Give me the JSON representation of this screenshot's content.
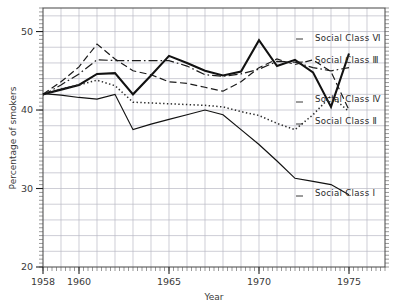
{
  "chart_data": {
    "type": "line",
    "title": "",
    "xlabel": "Year",
    "ylabel": "Percentage of smokers",
    "xlim": [
      1958,
      1977
    ],
    "ylim": [
      20,
      53
    ],
    "grid": true,
    "legend_position": "right-inline",
    "x_ticks": [
      "1958",
      "1960",
      "1965",
      "1970",
      "1975"
    ],
    "x_tick_values": [
      1958,
      1960,
      1965,
      1970,
      1975
    ],
    "y_ticks": [
      "20",
      "30",
      "40",
      "50"
    ],
    "y_tick_values": [
      20,
      30,
      40,
      50
    ],
    "x": [
      1958,
      1959,
      1960,
      1961,
      1962,
      1963,
      1964,
      1965,
      1966,
      1967,
      1968,
      1969,
      1970,
      1971,
      1972,
      1973,
      1974,
      1975
    ],
    "series": [
      {
        "name": "Social Class V",
        "label": "Social Class Ⅵ",
        "style": "solid-bold",
        "color": "#111111",
        "values": [
          42.0,
          42.6,
          43.2,
          44.6,
          44.7,
          42.0,
          44.4,
          46.9,
          46.0,
          45.0,
          44.4,
          44.9,
          48.9,
          45.6,
          46.4,
          44.8,
          40.4,
          47.2
        ]
      },
      {
        "name": "Social Class III",
        "label": "Social Class Ⅲ",
        "style": "dash-dot",
        "color": "#1b1b1b",
        "values": [
          41.9,
          43.2,
          44.6,
          46.4,
          46.3,
          46.3,
          46.3,
          46.3,
          45.6,
          44.5,
          44.3,
          44.6,
          45.2,
          46.2,
          46.1,
          45.4,
          45.0,
          45.4
        ]
      },
      {
        "name": "Social Class IV",
        "label": "Social Class Ⅳ",
        "style": "dashed",
        "color": "#1b1b1b",
        "values": [
          42.0,
          43.6,
          45.5,
          48.4,
          46.5,
          45.0,
          44.5,
          43.6,
          43.4,
          42.9,
          42.4,
          43.6,
          45.4,
          46.5,
          45.8,
          46.4,
          44.9,
          40.0
        ]
      },
      {
        "name": "Social Class II",
        "label": "Social Class Ⅱ",
        "style": "dotted",
        "color": "#2a2a2a",
        "values": [
          42.0,
          42.7,
          43.2,
          43.8,
          43.1,
          41.0,
          40.9,
          40.8,
          40.7,
          40.6,
          40.4,
          39.8,
          39.3,
          38.3,
          37.5,
          39.4,
          41.8,
          39.8
        ]
      },
      {
        "name": "Social Class I",
        "label": "Social Class Ⅰ",
        "style": "solid",
        "color": "#111111",
        "values": [
          42.1,
          41.9,
          41.6,
          41.4,
          42.0,
          37.5,
          38.2,
          38.8,
          39.4,
          40.0,
          39.4,
          37.5,
          35.6,
          33.5,
          31.3,
          30.9,
          30.5,
          29.2
        ]
      }
    ],
    "legend_annotations": [
      {
        "label_key": 0,
        "text": "Social Class Ⅵ",
        "anchor_x": 1975,
        "anchor_y": 47.2
      },
      {
        "label_key": 1,
        "text": "Social Class Ⅲ",
        "anchor_x": 1975,
        "anchor_y": 45.4
      },
      {
        "label_key": 2,
        "text": "Social Class Ⅳ",
        "anchor_x": 1975,
        "anchor_y": 40.0
      },
      {
        "label_key": 3,
        "text": "Social Class Ⅱ",
        "anchor_x": 1975,
        "anchor_y": 39.8
      },
      {
        "label_key": 4,
        "text": "Social Class Ⅰ",
        "anchor_x": 1975,
        "anchor_y": 29.2
      }
    ]
  },
  "legend": {
    "items": [
      {
        "text": "Social Class Ⅵ"
      },
      {
        "text": "Social Class Ⅲ"
      },
      {
        "text": "Social Class Ⅳ"
      },
      {
        "text": "Social Class Ⅱ"
      },
      {
        "text": "Social Class Ⅰ"
      }
    ]
  },
  "axes": {
    "y_label": "Percentage of smokers",
    "x_label": "Year",
    "y_tick_labels": [
      "50",
      "40",
      "30",
      "20"
    ],
    "x_tick_labels": [
      "1958",
      "1960",
      "1965",
      "1970",
      "1975"
    ]
  },
  "colors": {
    "frame": "#333333",
    "grid": "#b9b9c4",
    "line": "#111111",
    "text": "#2a2a2a",
    "background": "#ffffff"
  }
}
